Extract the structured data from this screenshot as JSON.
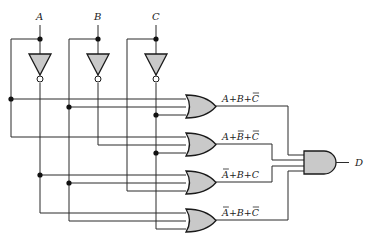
{
  "inputs": [
    {
      "name": "A"
    },
    {
      "name": "B"
    },
    {
      "name": "C"
    }
  ],
  "output": {
    "name": "D"
  },
  "or_gates": [
    {
      "label_parts": [
        {
          "t": "A",
          "bar": false
        },
        {
          "t": " + ",
          "bar": false
        },
        {
          "t": "B",
          "bar": false
        },
        {
          "t": " + ",
          "bar": false
        },
        {
          "t": "C",
          "bar": true
        }
      ],
      "text": "A + B + C̄"
    },
    {
      "label_parts": [
        {
          "t": "A",
          "bar": false
        },
        {
          "t": " + ",
          "bar": false
        },
        {
          "t": "B",
          "bar": true
        },
        {
          "t": " + ",
          "bar": false
        },
        {
          "t": "C",
          "bar": true
        }
      ],
      "text": "A + B̄ + C̄"
    },
    {
      "label_parts": [
        {
          "t": "A",
          "bar": true
        },
        {
          "t": " + ",
          "bar": false
        },
        {
          "t": "B",
          "bar": false
        },
        {
          "t": " + ",
          "bar": false
        },
        {
          "t": "C",
          "bar": false
        }
      ],
      "text": "Ā + B + C"
    },
    {
      "label_parts": [
        {
          "t": "A",
          "bar": true
        },
        {
          "t": " + ",
          "bar": false
        },
        {
          "t": "B",
          "bar": false
        },
        {
          "t": " + ",
          "bar": false
        },
        {
          "t": "C",
          "bar": true
        }
      ],
      "text": "Ā + B + C̄"
    }
  ],
  "and_gate": {
    "name": "AND",
    "output": "D"
  },
  "colors": {
    "gate_fill": "#c9c9c9",
    "wire": "#2b2b2b"
  }
}
